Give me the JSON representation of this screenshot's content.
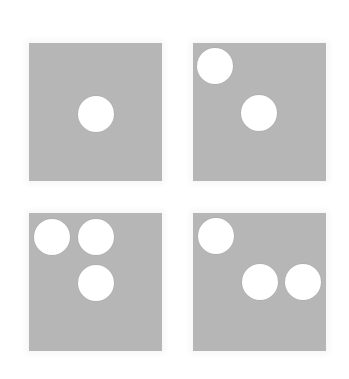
{
  "figure": {
    "background_color": "#ffffff",
    "panel_color": "#b6b6b6",
    "dot_color": "#ffffff",
    "panels": [
      {
        "id": "top-left",
        "dot_count": 1,
        "x": 29,
        "y": 43,
        "w": 133,
        "h": 138,
        "dots": [
          {
            "cx": 96,
            "cy": 114
          }
        ]
      },
      {
        "id": "top-right",
        "dot_count": 2,
        "x": 193,
        "y": 43,
        "w": 133,
        "h": 138,
        "dots": [
          {
            "cx": 215,
            "cy": 66
          },
          {
            "cx": 259,
            "cy": 113
          }
        ]
      },
      {
        "id": "bottom-left",
        "dot_count": 3,
        "x": 29,
        "y": 213,
        "w": 133,
        "h": 138,
        "dots": [
          {
            "cx": 52,
            "cy": 237
          },
          {
            "cx": 96,
            "cy": 237
          },
          {
            "cx": 96,
            "cy": 283
          }
        ]
      },
      {
        "id": "bottom-right",
        "dot_count": 3,
        "x": 193,
        "y": 213,
        "w": 133,
        "h": 138,
        "dots": [
          {
            "cx": 216,
            "cy": 236
          },
          {
            "cx": 260,
            "cy": 282
          },
          {
            "cx": 303,
            "cy": 282
          }
        ]
      }
    ],
    "dot_diameter": 36
  }
}
